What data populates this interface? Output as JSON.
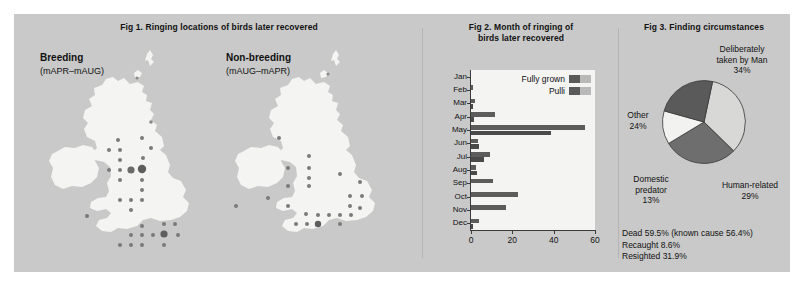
{
  "panel": {
    "background": "#c9c9c9"
  },
  "fig1": {
    "title": "Fig 1. Ringing locations of birds later recovered",
    "maps": [
      {
        "name": "breeding",
        "main": "Breeding",
        "sub": "(mAPR–mAUG)"
      },
      {
        "name": "non-breeding",
        "main": "Non-breeding",
        "sub": "(mAUG–mAPR)"
      }
    ]
  },
  "fig2": {
    "title_line1": "Fig 2. Month of ringing of",
    "title_line2": "birds later recovered",
    "legend": [
      {
        "label": "Fully grown",
        "dark": "#5a5a5a",
        "light": "#b9b9b9"
      },
      {
        "label": "Pulli",
        "dark": "#5a5a5a",
        "light": "#b9b9b9"
      }
    ],
    "xticks": [
      "0",
      "20",
      "40",
      "60"
    ]
  },
  "fig3": {
    "title": "Fig 3. Finding circumstances",
    "labels": [
      {
        "name": "deliberately-taken-by-man",
        "line1": "Deliberately",
        "line2": "taken by Man",
        "value": "34%"
      },
      {
        "name": "human-related",
        "line1": "Human-related",
        "line2": "",
        "value": "29%"
      },
      {
        "name": "domestic-predator",
        "line1": "Domestic",
        "line2": "predator",
        "value": "13%"
      },
      {
        "name": "other",
        "line1": "Other",
        "line2": "",
        "value": "24%"
      }
    ],
    "notes": [
      "Dead 59.5% (known cause 56.4%)",
      "Recaught 8.6%",
      "Resighted 31.9%"
    ]
  },
  "chart_data": [
    {
      "type": "bar",
      "orientation": "horizontal",
      "title": "Fig 2. Month of ringing of birds later recovered",
      "categories": [
        "Jan",
        "Feb",
        "Mar",
        "Apr",
        "May",
        "Jun",
        "Jul",
        "Aug",
        "Sep",
        "Oct",
        "Nov",
        "Dec"
      ],
      "series": [
        {
          "name": "Fully grown",
          "color": "#5c5c5c",
          "values": [
            0,
            1.2,
            2.0,
            11.5,
            55.0,
            3.5,
            9.0,
            2.5,
            10.5,
            22.5,
            17.0,
            4.0
          ]
        },
        {
          "name": "Pulli",
          "color": "#4a4a4a",
          "values": [
            0,
            0,
            1.0,
            1.5,
            38.5,
            4.0,
            6.5,
            3.0,
            0,
            0,
            0,
            1.0
          ]
        }
      ],
      "xlabel": "",
      "ylabel": "",
      "xlim": [
        0,
        60
      ],
      "xticks": [
        0,
        20,
        40,
        60
      ],
      "grid": false,
      "legend_position": "top-right"
    },
    {
      "type": "pie",
      "title": "Fig 3. Finding circumstances",
      "labels": [
        "Deliberately taken by Man",
        "Human-related",
        "Domestic predator",
        "Other"
      ],
      "values": [
        34,
        29,
        13,
        24
      ],
      "colors": [
        "#d8d8d6",
        "#6e6e6e",
        "#f2f2f0",
        "#5a5a5a"
      ],
      "unit": "%"
    }
  ]
}
